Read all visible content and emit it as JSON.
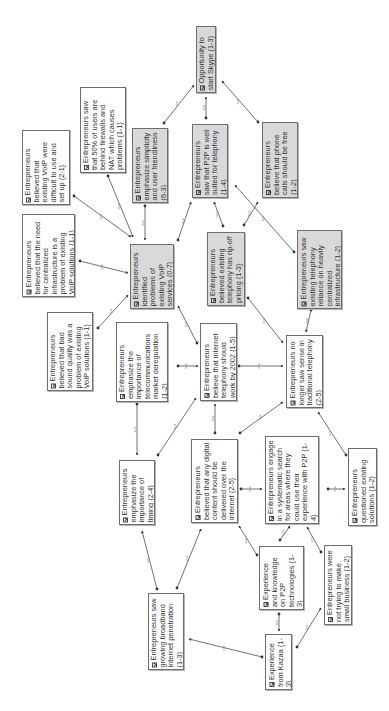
{
  "diagram": {
    "orientation": "rotated-90-ccw",
    "colors": {
      "shaded_node": "#d9d9d9",
      "plain_node": "#ffffff",
      "border": "#6e6e6e",
      "edge": "#333333",
      "text": "#333333"
    },
    "nodes": [
      {
        "id": "n0",
        "label": "Opportunity to start Skype {1-3}",
        "shaded": true,
        "x": 196,
        "y": 26,
        "w": 20,
        "h": 67
      },
      {
        "id": "n1",
        "label": "Entrepreneurs saw that 50% of users are behind firewalls and NAT which causes problems {1-1}",
        "shaded": false,
        "x": 80,
        "y": 87,
        "w": 46,
        "h": 86
      },
      {
        "id": "n2",
        "label": "Entrepreneurs believed that existing VoIP were difficult to use and set up {2-1}",
        "shaded": false,
        "x": 22,
        "y": 130,
        "w": 48,
        "h": 75
      },
      {
        "id": "n3",
        "label": "Entrepreneurs emphasize simplicity and user friendliness {6-3}",
        "shaded": true,
        "x": 132,
        "y": 128,
        "w": 36,
        "h": 75
      },
      {
        "id": "n4",
        "label": "Entrepreneurs saw that P2P is well suited for telephony {1-4}",
        "shaded": true,
        "x": 192,
        "y": 124,
        "w": 36,
        "h": 74
      },
      {
        "id": "n5",
        "label": "Entrepreneurs believe that phone calls should be free {1-2}",
        "shaded": true,
        "x": 262,
        "y": 122,
        "w": 36,
        "h": 76
      },
      {
        "id": "n6",
        "label": "Entrepreneurs believed that the need for centralized infrastructure is a problem of existing VoIP solutions {1-1}",
        "shaded": false,
        "x": 22,
        "y": 214,
        "w": 53,
        "h": 83
      },
      {
        "id": "n7",
        "label": "Entrepreneurs identified problems of existing VoIP services {0-7}",
        "shaded": true,
        "x": 130,
        "y": 244,
        "w": 44,
        "h": 65
      },
      {
        "id": "n8",
        "label": "Entrepreneurs believed existing telephony has rip-off pricing {1-3}",
        "shaded": true,
        "x": 207,
        "y": 232,
        "w": 38,
        "h": 74
      },
      {
        "id": "n9",
        "label": "Entrepreneurs saw existing telephony reliance on heavily centralized infrastructure {1-2}",
        "shaded": true,
        "x": 297,
        "y": 230,
        "w": 45,
        "h": 79
      },
      {
        "id": "n10",
        "label": "Entrepreneurs believed that bad sound quality was a problem of existing VoIP solutions {1-1}",
        "shaded": false,
        "x": 47,
        "y": 312,
        "w": 46,
        "h": 79
      },
      {
        "id": "n11",
        "label": "Entrepreneurs emphasize the importance of telecommunications market deregulation {1-2}",
        "shaded": false,
        "x": 116,
        "y": 322,
        "w": 52,
        "h": 80
      },
      {
        "id": "n12",
        "label": "Entrepreneurs believe that internet telephony should work by 2002 {1-5}",
        "shaded": false,
        "x": 200,
        "y": 323,
        "w": 37,
        "h": 78
      },
      {
        "id": "n13",
        "label": "Entrepreneurs no longer saw sense in traditional telephony {2-5}",
        "shaded": false,
        "x": 286,
        "y": 335,
        "w": 37,
        "h": 73
      },
      {
        "id": "n14",
        "label": "Entrepreneurs emphasize the importance of timing {2-4}",
        "shaded": false,
        "x": 119,
        "y": 460,
        "w": 36,
        "h": 65
      },
      {
        "id": "n15",
        "label": "Entrepreneurs believed that any digital content should be delivered over the internet {2-5}",
        "shaded": false,
        "x": 191,
        "y": 439,
        "w": 47,
        "h": 84
      },
      {
        "id": "n16",
        "label": "Entrepreneurs engage in a systematic search for areas where they could use their experience with P2P {1-4}",
        "shaded": false,
        "x": 265,
        "y": 436,
        "w": 54,
        "h": 88
      },
      {
        "id": "n17",
        "label": "Entrepreneurs questioned existing solutions {1-2}",
        "shaded": false,
        "x": 348,
        "y": 448,
        "w": 29,
        "h": 78
      },
      {
        "id": "n18",
        "label": "Entrepreneurs saw growing broadband internet penetration {1-3}",
        "shaded": false,
        "x": 148,
        "y": 593,
        "w": 36,
        "h": 77
      },
      {
        "id": "n19",
        "label": "Experience and knowledge on P2P technologies {1-3}",
        "shaded": false,
        "x": 259,
        "y": 546,
        "w": 45,
        "h": 64
      },
      {
        "id": "n20",
        "label": "Entrepreneurs were not trying to make small business {1-2}",
        "shaded": false,
        "x": 324,
        "y": 545,
        "w": 28,
        "h": 80
      },
      {
        "id": "n21",
        "label": "Experience from Kazaa {1-3}",
        "shaded": false,
        "x": 265,
        "y": 634,
        "w": 27,
        "h": 56
      }
    ],
    "edges": [
      {
        "x1": 164,
        "y1": 123,
        "x2": 194,
        "y2": 85,
        "label": "=="
      },
      {
        "x1": 206,
        "y1": 118,
        "x2": 206,
        "y2": 97,
        "label": "=="
      },
      {
        "x1": 258,
        "y1": 122,
        "x2": 222,
        "y2": 81,
        "label": "=="
      },
      {
        "x1": 108,
        "y1": 176,
        "x2": 133,
        "y2": 237,
        "label": "=="
      },
      {
        "x1": 74,
        "y1": 196,
        "x2": 131,
        "y2": 237,
        "label": "=="
      },
      {
        "x1": 145,
        "y1": 206,
        "x2": 145,
        "y2": 240,
        "label": "=="
      },
      {
        "x1": 178,
        "y1": 240,
        "x2": 191,
        "y2": 202,
        "label": "=>"
      },
      {
        "x1": 223,
        "y1": 226,
        "x2": 214,
        "y2": 202,
        "label": "=>"
      },
      {
        "x1": 244,
        "y1": 225,
        "x2": 258,
        "y2": 202,
        "label": "=>"
      },
      {
        "x1": 294,
        "y1": 252,
        "x2": 235,
        "y2": 185,
        "label": "=="
      },
      {
        "x1": 80,
        "y1": 261,
        "x2": 128,
        "y2": 273,
        "label": "=="
      },
      {
        "x1": 98,
        "y1": 328,
        "x2": 128,
        "y2": 295,
        "label": "=="
      },
      {
        "x1": 197,
        "y1": 343,
        "x2": 178,
        "y2": 306,
        "label": "=>"
      },
      {
        "x1": 248,
        "y1": 298,
        "x2": 283,
        "y2": 343,
        "label": "=="
      },
      {
        "x1": 311,
        "y1": 310,
        "x2": 306,
        "y2": 332,
        "label": "=="
      },
      {
        "x1": 178,
        "y1": 366,
        "x2": 198,
        "y2": 366,
        "label": "=>"
      },
      {
        "x1": 239,
        "y1": 366,
        "x2": 283,
        "y2": 366,
        "label": "=="
      },
      {
        "x1": 137,
        "y1": 404,
        "x2": 137,
        "y2": 455,
        "label": "=>"
      },
      {
        "x1": 158,
        "y1": 455,
        "x2": 196,
        "y2": 398,
        "label": "=>"
      },
      {
        "x1": 215,
        "y1": 433,
        "x2": 215,
        "y2": 404,
        "label": "=="
      },
      {
        "x1": 240,
        "y1": 433,
        "x2": 283,
        "y2": 402,
        "label": "=>"
      },
      {
        "x1": 241,
        "y1": 489,
        "x2": 262,
        "y2": 489,
        "label": "=="
      },
      {
        "x1": 328,
        "y1": 489,
        "x2": 345,
        "y2": 489,
        "label": "=>"
      },
      {
        "x1": 346,
        "y1": 455,
        "x2": 318,
        "y2": 412,
        "label": "=>"
      },
      {
        "x1": 157,
        "y1": 589,
        "x2": 142,
        "y2": 531,
        "label": "=>"
      },
      {
        "x1": 177,
        "y1": 588,
        "x2": 201,
        "y2": 529,
        "label": "=>"
      },
      {
        "x1": 257,
        "y1": 555,
        "x2": 239,
        "y2": 526,
        "label": "=="
      },
      {
        "x1": 280,
        "y1": 540,
        "x2": 290,
        "y2": 526,
        "label": "=>"
      },
      {
        "x1": 321,
        "y1": 552,
        "x2": 307,
        "y2": 527,
        "label": "=>"
      },
      {
        "x1": 279,
        "y1": 614,
        "x2": 279,
        "y2": 631,
        "label": "=="
      },
      {
        "x1": 262,
        "y1": 657,
        "x2": 189,
        "y2": 639,
        "label": "=="
      },
      {
        "x1": 297,
        "y1": 647,
        "x2": 321,
        "y2": 608,
        "label": "=="
      }
    ]
  }
}
